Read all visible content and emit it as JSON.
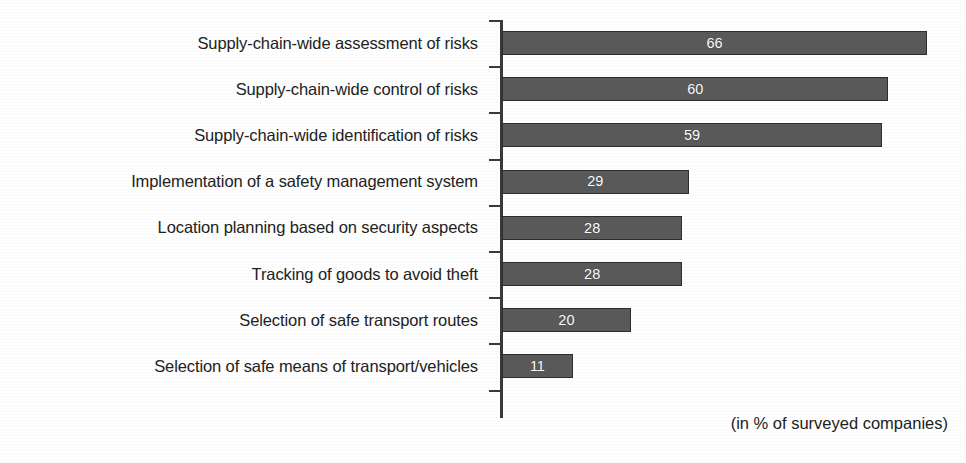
{
  "chart_data": {
    "type": "bar",
    "orientation": "horizontal",
    "title": "",
    "subtitle": "",
    "xlabel": "",
    "ylabel": "",
    "note": "(in % of surveyed companies)",
    "unit": "%",
    "grid": false,
    "legend": false,
    "xlim": [
      0,
      70
    ],
    "categories": [
      "Supply-chain-wide assessment of risks",
      "Supply-chain-wide control of risks",
      "Supply-chain-wide identification of risks",
      "Implementation of a safety management system",
      "Location planning based on security aspects",
      "Tracking of goods to avoid theft",
      "Selection of safe transport routes",
      "Selection of safe means of transport/vehicles"
    ],
    "values": [
      66,
      60,
      59,
      29,
      28,
      28,
      20,
      11
    ],
    "value_labels": [
      "66",
      "60",
      "59",
      "29",
      "28",
      "28",
      "20",
      "11"
    ],
    "bar_color": "#5a5a5a",
    "bar_border_color": "#2e2e2e",
    "value_label_color": "#ffffff",
    "axis_color": "#3a3a3a",
    "background_color": "#ffffff",
    "text_color": "#222222"
  }
}
